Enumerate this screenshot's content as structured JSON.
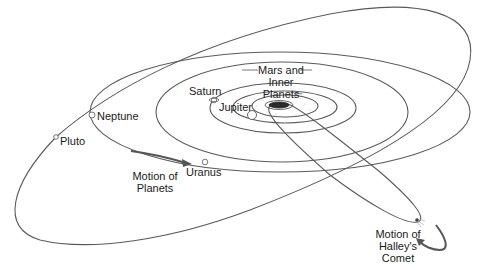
{
  "diagram": {
    "type": "solar-system-orbits",
    "colors": {
      "orbit": "#555555",
      "text": "#1a1a1a",
      "background": "#ffffff"
    },
    "labels": {
      "mars_inner_1": "Mars and",
      "mars_inner_2": "Inner",
      "mars_inner_3": "Planets",
      "saturn": "Saturn",
      "jupiter": "Jupiter",
      "neptune": "Neptune",
      "pluto": "Pluto",
      "uranus": "Uranus",
      "motion_planets_1": "Motion of",
      "motion_planets_2": "Planets",
      "motion_comet_1": "Motion of",
      "motion_comet_2": "Halley's",
      "motion_comet_3": "Comet"
    },
    "bodies": [
      "Sun",
      "Mars and Inner Planets",
      "Jupiter",
      "Saturn",
      "Uranus",
      "Neptune",
      "Pluto",
      "Halley's Comet"
    ]
  }
}
